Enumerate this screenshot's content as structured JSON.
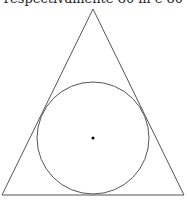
{
  "caption": "respectivamente 80 m e 80",
  "colors": {
    "stroke": "#555555",
    "dot": "#000000",
    "text": "#222222",
    "background": "#ffffff"
  },
  "figure": {
    "triangle": {
      "apex": [
        93,
        9
      ],
      "base_left": [
        2,
        195
      ],
      "base_right": [
        184,
        195
      ]
    },
    "inscribed_circle": {
      "center": [
        93,
        138
      ],
      "radius": 56
    },
    "center_point": [
      93,
      138
    ]
  }
}
